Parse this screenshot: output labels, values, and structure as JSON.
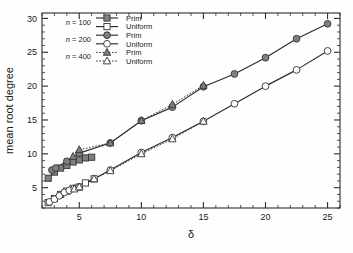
{
  "chart_data": {
    "type": "scatter",
    "title": "",
    "xlabel": "δ",
    "ylabel": "mean root degree",
    "xlim": [
      2.0,
      26.0
    ],
    "ylim": [
      2.0,
      30.8
    ],
    "xticks": [
      5,
      10,
      15,
      20,
      25
    ],
    "xtick_labels": [
      "5",
      "10",
      "15",
      "20",
      "25"
    ],
    "yticks": [
      5,
      10,
      15,
      20,
      25,
      30
    ],
    "ytick_labels": [
      "5",
      "10",
      "15",
      "20",
      "25",
      "30"
    ],
    "x_minor_step": 1,
    "y_minor_step": 1,
    "grid": false,
    "legend_position": "upper-left",
    "series": [
      {
        "name": "n = 100 Prim",
        "group": "n = 100",
        "variant": "Prim",
        "marker": "square",
        "fill": "filled",
        "line": "solid",
        "color": "#808080",
        "points": [
          {
            "x": 2.5,
            "y": 6.4
          },
          {
            "x": 3.0,
            "y": 7.3
          },
          {
            "x": 3.5,
            "y": 7.9
          },
          {
            "x": 4.0,
            "y": 8.3
          },
          {
            "x": 4.5,
            "y": 8.8
          },
          {
            "x": 5.0,
            "y": 9.1
          },
          {
            "x": 5.5,
            "y": 9.4
          },
          {
            "x": 6.0,
            "y": 9.5
          }
        ]
      },
      {
        "name": "n = 100 Uniform",
        "group": "n = 100",
        "variant": "Uniform",
        "marker": "square",
        "fill": "open",
        "line": "solid",
        "color": "#ffffff",
        "points": [
          {
            "x": 2.5,
            "y": 2.8
          },
          {
            "x": 3.0,
            "y": 3.4
          },
          {
            "x": 3.5,
            "y": 4.0
          },
          {
            "x": 4.0,
            "y": 4.5
          },
          {
            "x": 4.5,
            "y": 4.9
          },
          {
            "x": 5.0,
            "y": 5.1
          },
          {
            "x": 5.5,
            "y": 5.7
          },
          {
            "x": 6.2,
            "y": 6.3
          }
        ]
      },
      {
        "name": "n = 200 Prim",
        "group": "n = 200",
        "variant": "Prim",
        "marker": "circle",
        "fill": "filled",
        "line": "solid",
        "color": "#808080",
        "points": [
          {
            "x": 2.8,
            "y": 7.6
          },
          {
            "x": 3.1,
            "y": 7.9
          },
          {
            "x": 4.0,
            "y": 8.9
          },
          {
            "x": 5.0,
            "y": 10.1
          },
          {
            "x": 7.5,
            "y": 11.6
          },
          {
            "x": 10.0,
            "y": 14.9
          },
          {
            "x": 12.5,
            "y": 16.9
          },
          {
            "x": 15.0,
            "y": 19.9
          },
          {
            "x": 17.5,
            "y": 21.8
          },
          {
            "x": 20.0,
            "y": 24.2
          },
          {
            "x": 22.5,
            "y": 27.0
          },
          {
            "x": 25.0,
            "y": 29.2
          }
        ]
      },
      {
        "name": "n = 200 Uniform",
        "group": "n = 200",
        "variant": "Uniform",
        "marker": "circle",
        "fill": "open",
        "line": "solid",
        "color": "#ffffff",
        "points": [
          {
            "x": 2.6,
            "y": 2.9
          },
          {
            "x": 3.0,
            "y": 3.3
          },
          {
            "x": 3.4,
            "y": 3.8
          },
          {
            "x": 3.8,
            "y": 4.3
          },
          {
            "x": 4.2,
            "y": 4.6
          },
          {
            "x": 4.6,
            "y": 4.9
          },
          {
            "x": 5.0,
            "y": 5.1
          },
          {
            "x": 7.5,
            "y": 7.6
          },
          {
            "x": 10.0,
            "y": 10.2
          },
          {
            "x": 12.5,
            "y": 12.4
          },
          {
            "x": 15.0,
            "y": 14.8
          },
          {
            "x": 17.5,
            "y": 17.4
          },
          {
            "x": 20.0,
            "y": 20.0
          },
          {
            "x": 22.5,
            "y": 22.4
          },
          {
            "x": 25.0,
            "y": 25.2
          }
        ]
      },
      {
        "name": "n = 400 Prim",
        "group": "n = 400",
        "variant": "Prim",
        "marker": "triangle",
        "fill": "filled",
        "line": "dotted",
        "color": "#808080",
        "points": [
          {
            "x": 4.5,
            "y": 9.6
          },
          {
            "x": 5.0,
            "y": 10.6
          },
          {
            "x": 7.5,
            "y": 11.6
          },
          {
            "x": 10.0,
            "y": 14.9
          },
          {
            "x": 12.5,
            "y": 17.3
          },
          {
            "x": 15.0,
            "y": 20.1
          }
        ]
      },
      {
        "name": "n = 400 Uniform",
        "group": "n = 400",
        "variant": "Uniform",
        "marker": "triangle",
        "fill": "open",
        "line": "dotted",
        "color": "#ffffff",
        "points": [
          {
            "x": 4.6,
            "y": 4.8
          },
          {
            "x": 5.0,
            "y": 5.1
          },
          {
            "x": 6.2,
            "y": 6.3
          },
          {
            "x": 7.5,
            "y": 7.5
          },
          {
            "x": 10.0,
            "y": 10.0
          },
          {
            "x": 12.5,
            "y": 12.2
          },
          {
            "x": 15.0,
            "y": 14.8
          }
        ]
      }
    ],
    "legend": [
      {
        "group": "n = 100",
        "n_prefix": "n",
        "n_value": " = 100",
        "marker": "square",
        "entries": [
          {
            "label": "Prim",
            "fill": "filled",
            "line": "solid"
          },
          {
            "label": "Uniform",
            "fill": "open",
            "line": "solid"
          }
        ]
      },
      {
        "group": "n = 200",
        "n_prefix": "n",
        "n_value": " = 200",
        "marker": "circle",
        "entries": [
          {
            "label": "Prim",
            "fill": "filled",
            "line": "solid"
          },
          {
            "label": "Uniform",
            "fill": "open",
            "line": "solid"
          }
        ]
      },
      {
        "group": "n = 400",
        "n_prefix": "n",
        "n_value": " = 400",
        "marker": "triangle",
        "entries": [
          {
            "label": "Prim",
            "fill": "filled",
            "line": "dotted"
          },
          {
            "label": "Uniform",
            "fill": "open",
            "line": "dotted"
          }
        ]
      }
    ],
    "colors": {
      "marker_fill_gray": "#808080",
      "marker_open": "#ffffff",
      "line": "#2b2b2b",
      "axis": "#2b2b2b",
      "text": "#1a1a1a",
      "background": "#fefefe"
    }
  }
}
